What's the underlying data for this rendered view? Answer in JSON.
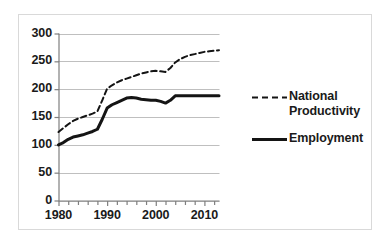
{
  "chart_data": {
    "type": "line",
    "title": "",
    "subtitle": "",
    "xlabel": "",
    "ylabel": "",
    "xlim": [
      1980,
      2013
    ],
    "ylim": [
      0,
      300
    ],
    "grid": "horizontal",
    "legend_position": "right",
    "y_ticks": [
      "300",
      "250",
      "200",
      "150",
      "100",
      "50",
      "0"
    ],
    "y_tick_values": [
      300,
      250,
      200,
      150,
      100,
      50,
      0
    ],
    "x_ticks": [
      "1980",
      "1990",
      "2000",
      "2010"
    ],
    "x_tick_values": [
      1980,
      1990,
      2000,
      2010
    ],
    "x_minor_tick_interval": 2,
    "x": [
      1980,
      1981,
      1982,
      1983,
      1984,
      1985,
      1986,
      1987,
      1988,
      1989,
      1990,
      1991,
      1992,
      1993,
      1994,
      1995,
      1996,
      1997,
      1998,
      1999,
      2000,
      2001,
      2002,
      2003,
      2004,
      2005,
      2006,
      2007,
      2008,
      2009,
      2010,
      2011,
      2012,
      2013
    ],
    "series": [
      {
        "name": "National Productivity",
        "style": "dashed",
        "color": "#141414",
        "values": [
          123,
          130,
          137,
          143,
          147,
          150,
          153,
          156,
          160,
          180,
          201,
          207,
          212,
          216,
          219,
          222,
          225,
          228,
          230,
          232,
          233,
          232,
          231,
          238,
          248,
          254,
          258,
          261,
          263,
          265,
          267,
          268,
          269,
          270
        ]
      },
      {
        "name": "Employment",
        "style": "solid",
        "color": "#141414",
        "values": [
          100,
          104,
          110,
          114,
          116,
          118,
          121,
          124,
          128,
          146,
          166,
          172,
          176,
          180,
          184,
          185,
          184,
          182,
          181,
          180,
          180,
          178,
          175,
          180,
          188,
          188,
          188,
          188,
          188,
          188,
          188,
          188,
          188,
          188
        ]
      }
    ]
  },
  "legend": {
    "items": [
      {
        "label_line1": "National",
        "label_line2": "Productivity",
        "style": "dashed"
      },
      {
        "label_line1": "Employment",
        "label_line2": "",
        "style": "solid"
      }
    ]
  },
  "colors": {
    "line": "#141414",
    "grid": "#bfbfbf",
    "axis": "#7f7f7f",
    "frame": "#d9d9d9",
    "background": "#ffffff",
    "text": "#1a1a1a"
  }
}
